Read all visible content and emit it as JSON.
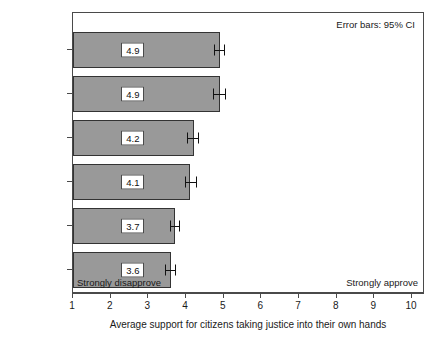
{
  "chart_data": {
    "type": "bar",
    "orientation": "horizontal",
    "title": "",
    "subtitle": "",
    "xlabel": "Average support for citizens taking justice into their own hands",
    "ylabel": "",
    "xlim": [
      1,
      10
    ],
    "xticks": [
      1,
      2,
      3,
      4,
      5,
      6,
      7,
      8,
      9,
      10
    ],
    "xticklabels": [
      "1",
      "2",
      "3",
      "4",
      "5",
      "6",
      "7",
      "8",
      "9",
      "10"
    ],
    "grid": false,
    "legend": null,
    "categories": [
      "Guatemala",
      "El Salvador",
      "Nicaragua",
      "Honduras",
      "Panama",
      "Costa Rica"
    ],
    "values": [
      4.9,
      4.9,
      4.2,
      4.1,
      3.7,
      3.6
    ],
    "value_labels": [
      "4.9",
      "4.9",
      "4.2",
      "4.1",
      "3.7",
      "3.6"
    ],
    "error_low": [
      4.75,
      4.72,
      4.03,
      3.98,
      3.57,
      3.44
    ],
    "error_high": [
      5.04,
      5.07,
      4.34,
      4.28,
      3.85,
      3.74
    ],
    "annotations": [
      {
        "name": "ci-note",
        "text": "Error bars: 95% CI",
        "position": "top-right"
      },
      {
        "name": "anchor-low",
        "text": "Strongly disapprove",
        "position": "bottom-left"
      },
      {
        "name": "anchor-high",
        "text": "Strongly approve",
        "position": "bottom-right"
      }
    ],
    "colors": {
      "bar_fill": "#999999",
      "bar_edge": "#333333",
      "error_bar": "#111111",
      "axis": "#4a4a4a",
      "text": "#1a1a1a",
      "background": "#ffffff",
      "label_box_fill": "#ffffff"
    }
  }
}
